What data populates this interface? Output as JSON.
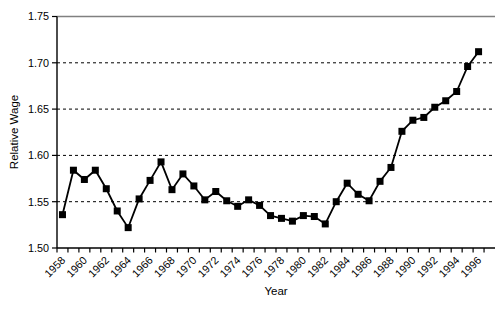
{
  "figure": {
    "background": "#ffffff",
    "axis_color": "#000000",
    "top_border_color": "#808080",
    "gridline_color": "#000000",
    "series_color": "#000000",
    "marker_color": "#000000"
  },
  "chart_data": {
    "type": "line",
    "title": "",
    "xlabel": "Year",
    "ylabel": "Relative Wage",
    "x": [
      1958,
      1959,
      1960,
      1961,
      1962,
      1963,
      1964,
      1965,
      1966,
      1967,
      1968,
      1969,
      1970,
      1971,
      1972,
      1973,
      1974,
      1975,
      1976,
      1977,
      1978,
      1979,
      1980,
      1981,
      1982,
      1983,
      1984,
      1985,
      1986,
      1987,
      1988,
      1989,
      1990,
      1991,
      1992,
      1993,
      1994,
      1995,
      1996
    ],
    "values": [
      1.536,
      1.584,
      1.574,
      1.584,
      1.564,
      1.54,
      1.522,
      1.553,
      1.573,
      1.593,
      1.563,
      1.58,
      1.567,
      1.552,
      1.561,
      1.551,
      1.545,
      1.552,
      1.546,
      1.535,
      1.532,
      1.529,
      1.535,
      1.534,
      1.526,
      1.55,
      1.57,
      1.558,
      1.551,
      1.572,
      1.587,
      1.626,
      1.638,
      1.641,
      1.652,
      1.659,
      1.669,
      1.696,
      1.712
    ],
    "ylim": [
      1.5,
      1.75
    ],
    "ytick_step": 0.05,
    "ytick_labels": [
      "1.50",
      "1.55",
      "1.60",
      "1.65",
      "1.70",
      "1.75"
    ],
    "xtick_labels": [
      "1958",
      "1960",
      "1962",
      "1964",
      "1966",
      "1968",
      "1970",
      "1972",
      "1974",
      "1976",
      "1978",
      "1980",
      "1982",
      "1984",
      "1986",
      "1988",
      "1990",
      "1992",
      "1994",
      "1996"
    ],
    "xtick_label_every": 2,
    "grid": "horizontal-dashed",
    "legend": "none",
    "marker": "filled-square",
    "line_width": 1.8,
    "marker_size": 7
  }
}
